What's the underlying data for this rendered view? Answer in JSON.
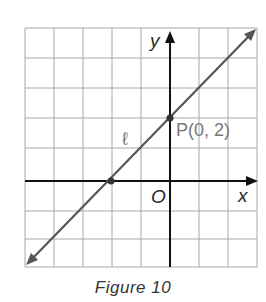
{
  "figure": {
    "caption": "Figure 10",
    "axis_x_label": "x",
    "axis_y_label": "y",
    "origin_label": "O",
    "line_label": "ℓ",
    "point_label": "P(0, 2)"
  },
  "grid": {
    "x_min": -5,
    "x_max": 3,
    "y_min": -3,
    "y_max": 5,
    "step": 1
  },
  "line": {
    "name": "ℓ",
    "slope": 1,
    "y_intercept": 2,
    "passes_through": [
      [
        -2,
        0
      ],
      [
        0,
        2
      ]
    ]
  },
  "points": [
    {
      "name": "P",
      "x": 0,
      "y": 2
    },
    {
      "name": "x-intercept",
      "x": -2,
      "y": 0
    }
  ],
  "colors": {
    "grid": "#a8a8a8",
    "axes": "#111111",
    "line": "#555555",
    "label": "#666666"
  }
}
